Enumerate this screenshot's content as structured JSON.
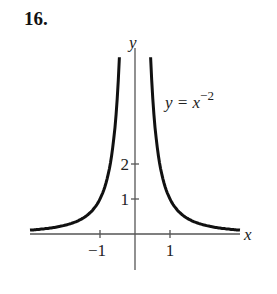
{
  "problem_number": "16.",
  "chart_data": {
    "type": "line",
    "title": "",
    "function_label": "y = x",
    "function_exponent": "−2",
    "xlabel": "x",
    "ylabel": "y",
    "x_ticks": [
      {
        "value": -1,
        "label": "−1"
      },
      {
        "value": 1,
        "label": "1"
      }
    ],
    "y_ticks": [
      {
        "value": 1,
        "label": "1"
      },
      {
        "value": 2,
        "label": "2"
      }
    ],
    "xlim": [
      -3.0,
      3.1
    ],
    "ylim": [
      -1.6,
      5.5
    ],
    "grid": false,
    "legend": null,
    "series": [
      {
        "name": "y = x^-2",
        "branch": "left",
        "x": [
          -3.0,
          -2.5,
          -2.0,
          -1.5,
          -1.0,
          -0.8,
          -0.7,
          -0.6,
          -0.5,
          -0.45
        ],
        "values": [
          0.111,
          0.16,
          0.25,
          0.444,
          1.0,
          1.5625,
          2.041,
          2.778,
          4.0,
          4.94
        ]
      },
      {
        "name": "y = x^-2",
        "branch": "right",
        "x": [
          0.45,
          0.5,
          0.6,
          0.7,
          0.8,
          1.0,
          1.5,
          2.0,
          2.5,
          3.0
        ],
        "values": [
          4.94,
          4.0,
          2.778,
          2.041,
          1.5625,
          1.0,
          0.444,
          0.25,
          0.16,
          0.111
        ]
      }
    ],
    "colors": {
      "curve": "#111111",
      "axes": "#555555"
    }
  }
}
